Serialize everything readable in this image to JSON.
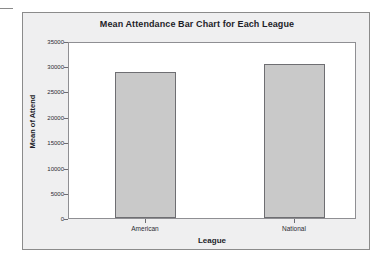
{
  "chart_data": {
    "type": "bar",
    "title": "Mean Attendance Bar Chart for Each League",
    "xlabel": "League",
    "ylabel": "Mean of Attend",
    "categories": [
      "American",
      "National"
    ],
    "values": [
      29200,
      30800
    ],
    "ylim": [
      0,
      35000
    ],
    "yticks": [
      0,
      5000,
      10000,
      15000,
      20000,
      25000,
      30000,
      35000
    ],
    "ytick_labels": [
      "0",
      "5000",
      "10000",
      "15000",
      "20000",
      "25000",
      "30000",
      "35000"
    ],
    "grid": false,
    "legend": false,
    "bar_color": "#c9c9c9",
    "bar_edge_color": "#6e6e72",
    "plot_background": "#ffffff",
    "panel_background": "#efeff0",
    "panel_border_color": "#8b8b8b",
    "text_color": "#1d1d28"
  }
}
